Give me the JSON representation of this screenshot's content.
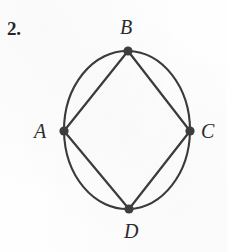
{
  "figure": {
    "item_number": "2.",
    "background_color": "#fefefe",
    "ink_color": "#3a3a3a",
    "label_color": "#2b2b2b",
    "vertex_dot_color": "#3c3c3c"
  },
  "vertices": [
    {
      "id": "A",
      "label": "A",
      "cx": 64,
      "cy": 131,
      "r": 4.6,
      "label_x": 34,
      "label_y": 121
    },
    {
      "id": "B",
      "label": "B",
      "cx": 128,
      "cy": 51,
      "r": 4.6,
      "label_x": 120,
      "label_y": 17
    },
    {
      "id": "C",
      "label": "C",
      "cx": 190,
      "cy": 131,
      "r": 4.6,
      "label_x": 201,
      "label_y": 121
    },
    {
      "id": "D",
      "label": "D",
      "cx": 129,
      "cy": 209,
      "r": 4.6,
      "label_x": 124,
      "label_y": 221
    }
  ],
  "edges": {
    "chords": [
      {
        "from": "A",
        "to": "B"
      },
      {
        "from": "B",
        "to": "C"
      },
      {
        "from": "C",
        "to": "D"
      },
      {
        "from": "D",
        "to": "A"
      }
    ],
    "arcs": [
      {
        "from": "A",
        "to": "B",
        "bulge": "outward-upper-left"
      },
      {
        "from": "B",
        "to": "C",
        "bulge": "outward-upper-right"
      },
      {
        "from": "C",
        "to": "D",
        "bulge": "outward-lower-right"
      },
      {
        "from": "D",
        "to": "A",
        "bulge": "outward-lower-left"
      }
    ]
  },
  "ellipse": {
    "cx": 127,
    "cy": 130,
    "rx": 63,
    "ry": 79.5
  },
  "stroke": {
    "width": 2.1,
    "linecap": "round"
  }
}
